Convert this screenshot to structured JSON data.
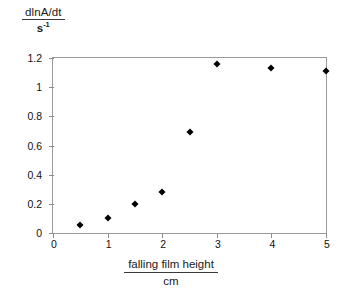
{
  "chart_data": {
    "type": "scatter",
    "title": "",
    "ylabel_numerator": "dlnA/dt",
    "ylabel_denominator": "s",
    "ylabel_denominator_exponent": "-1",
    "xlabel_numerator": "falling film height",
    "xlabel_denominator": "cm",
    "xlim": [
      0,
      5
    ],
    "ylim": [
      0,
      1.2
    ],
    "xticks": [
      0,
      1,
      2,
      3,
      4,
      5
    ],
    "xtick_labels": [
      "0",
      "1",
      "2",
      "3",
      "4",
      "5"
    ],
    "yticks": [
      0,
      0.2,
      0.4,
      0.6,
      0.8,
      1,
      1.2
    ],
    "ytick_labels": [
      "0",
      "0.2",
      "0.4",
      "0.6",
      "0.8",
      "1",
      "1.2"
    ],
    "grid": false,
    "legend": false,
    "marker_shape": "diamond",
    "marker_color": "#000000",
    "frame_color": "#9a9a9a",
    "background_color": "#ffffff",
    "x": [
      0.5,
      1,
      1.5,
      2,
      2.5,
      3,
      4,
      5
    ],
    "y": [
      0.055,
      0.105,
      0.2,
      0.28,
      0.69,
      1.16,
      1.13,
      1.11
    ],
    "points": [
      {
        "x": 0.5,
        "y": 0.055
      },
      {
        "x": 1,
        "y": 0.105
      },
      {
        "x": 1.5,
        "y": 0.2
      },
      {
        "x": 2,
        "y": 0.28
      },
      {
        "x": 2.5,
        "y": 0.69
      },
      {
        "x": 3,
        "y": 1.16
      },
      {
        "x": 4,
        "y": 1.13
      },
      {
        "x": 5,
        "y": 1.11
      }
    ]
  }
}
